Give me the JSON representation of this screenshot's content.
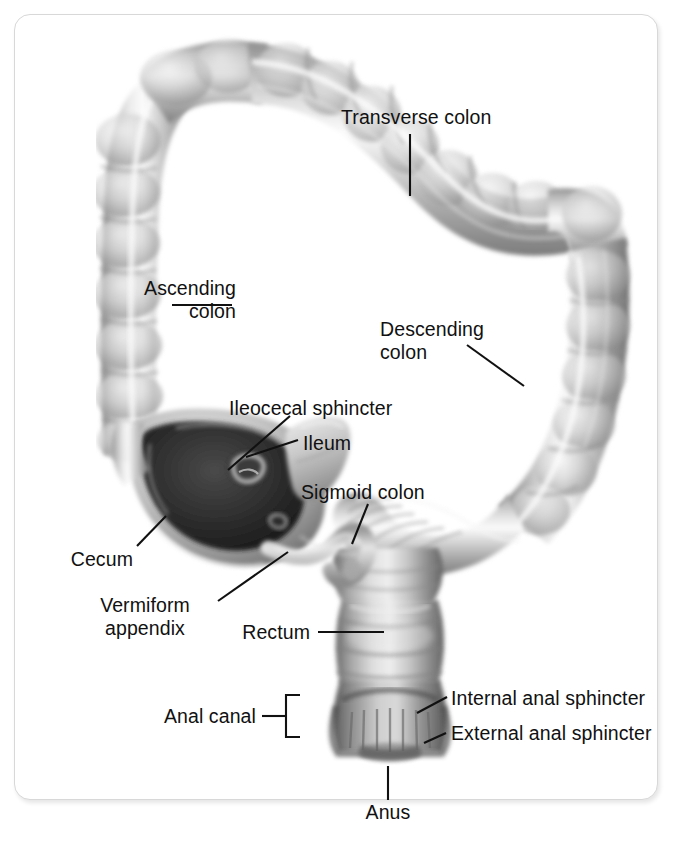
{
  "figure": {
    "style": "grayscale anatomical illustration",
    "frame_color": "#d8d8d8",
    "background_color": "#ffffff",
    "label_color": "#111111"
  },
  "labels": {
    "transverse_colon": "Transverse colon",
    "ascending_colon": "Ascending\ncolon",
    "descending_colon": "Descending\ncolon",
    "ileocecal_sphincter": "Ileocecal sphincter",
    "ileum": "Ileum",
    "sigmoid_colon": "Sigmoid colon",
    "cecum": "Cecum",
    "vermiform_appendix": "Vermiform\nappendix",
    "rectum": "Rectum",
    "anal_canal": "Anal canal",
    "internal_anal_sphincter": "Internal anal sphincter",
    "external_anal_sphincter": "External anal sphincter",
    "anus": "Anus"
  }
}
